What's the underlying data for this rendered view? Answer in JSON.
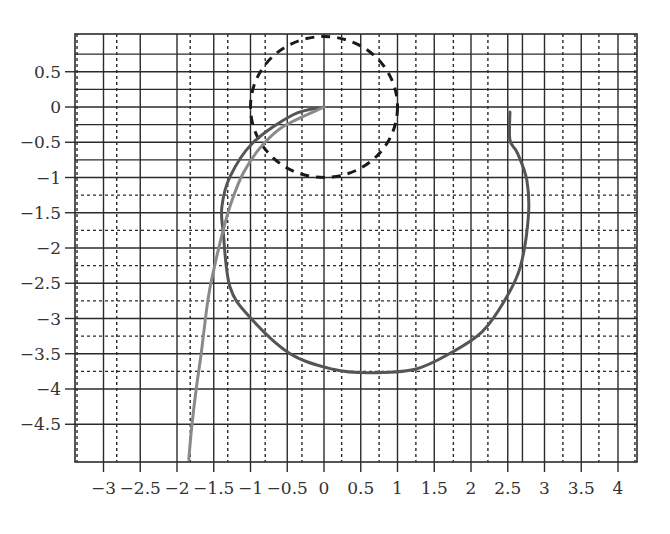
{
  "chart_data": {
    "type": "line",
    "title": "",
    "xlabel": "",
    "ylabel": "",
    "xlim": [
      -3.39,
      4.26
    ],
    "ylim": [
      -5.03,
      1.03
    ],
    "grid": true,
    "legend": null,
    "x_ticks": [
      -3,
      -2.5,
      -2,
      -1.5,
      -1,
      -0.5,
      0,
      0.5,
      1,
      1.5,
      2,
      2.5,
      3,
      3.5,
      4
    ],
    "x_tick_labels": [
      "−3",
      "−2.5",
      "−2",
      "−1.5",
      "−1",
      "−0.5",
      "0",
      "0.5",
      "1",
      "1.5",
      "2",
      "2.5",
      "3",
      "3.5",
      "4"
    ],
    "y_ticks": [
      0.5,
      0,
      -0.5,
      -1,
      -1.5,
      -2,
      -2.5,
      -3,
      -3.5,
      -4,
      -4.5
    ],
    "y_tick_labels": [
      "0.5",
      "0",
      "−0.5",
      "−1",
      "−1.5",
      "−2",
      "−2.5",
      "−3",
      "−3.5",
      "−4",
      "−4.5"
    ],
    "grid_lines": {
      "vertical_solid": [
        -3,
        -2.5,
        -2,
        -1.5,
        -1,
        -0.5,
        0,
        0.5,
        1,
        1.5,
        2,
        2.5,
        2.7,
        3,
        3.5,
        4
      ],
      "vertical_dotted": [
        -3.36,
        -2.82,
        -1.82,
        -1.31,
        -0.8,
        -0.3,
        0.24,
        0.75,
        1.25,
        1.76,
        2.23,
        3.25,
        3.74,
        4.23
      ],
      "horizontal_solid": [
        0.75,
        0.5,
        0.25,
        0,
        -0.25,
        -0.5,
        -0.75,
        -1,
        -1.5,
        -2,
        -2.5,
        -3,
        -3.5,
        -4,
        -4.5
      ],
      "horizontal_dotted": [
        -1.25,
        -1.75,
        -2.25,
        -2.75,
        -3.25,
        -3.75
      ]
    },
    "series": [
      {
        "name": "unit circle",
        "style": "dashed",
        "color": "#1a1a1a",
        "shape": "circle",
        "center": [
          0,
          0
        ],
        "radius": 1
      },
      {
        "name": "loop curve",
        "style": "solid",
        "color": "#555555",
        "x": [
          0,
          -0.42,
          -0.97,
          -1.28,
          -1.39,
          -1.37,
          -1.28,
          -1.01,
          -0.46,
          0.12,
          0.6,
          1.24,
          1.74,
          2.15,
          2.46,
          2.67,
          2.78,
          2.76,
          2.63,
          2.53,
          2.53
        ],
        "y": [
          0,
          -0.11,
          -0.51,
          -0.99,
          -1.42,
          -1.79,
          -2.55,
          -2.98,
          -3.5,
          -3.72,
          -3.77,
          -3.72,
          -3.48,
          -3.19,
          -2.74,
          -2.27,
          -1.56,
          -1.04,
          -0.65,
          -0.47,
          -0.07
        ]
      },
      {
        "name": "descending curve",
        "style": "solid",
        "color": "#8a8a8a",
        "x": [
          0,
          -0.56,
          -0.87,
          -1.1,
          -1.25,
          -1.37,
          -1.5,
          -1.58,
          -1.67,
          -1.74,
          -1.8,
          -1.84
        ],
        "y": [
          0,
          -0.28,
          -0.58,
          -0.94,
          -1.32,
          -1.74,
          -2.31,
          -2.74,
          -3.49,
          -4.01,
          -4.54,
          -5.0
        ]
      }
    ]
  },
  "colors": {
    "grid": "#2b2b2b",
    "background": "#ffffff",
    "tick_text": "#333333"
  }
}
